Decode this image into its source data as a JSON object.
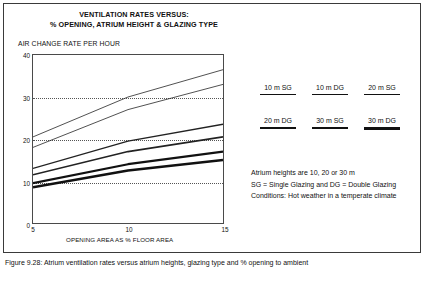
{
  "figure": {
    "title_line1": "VENTILATION RATES VERSUS:",
    "title_line2": "% OPENING, ATRIUM HEIGHT & GLAZING TYPE",
    "y_axis_title": "AIR CHANGE RATE PER HOUR",
    "x_axis_title": "OPENING AREA AS % FLOOR AREA",
    "caption": "Figure 9.28: Atrium ventilation rates versus atrium heights, glazing type and % opening to ambient"
  },
  "notes": {
    "line1": "Atrium heights are 10, 20 or 30 m",
    "line2": "SG = Single Glazing and DG = Double Glazing",
    "line3": "Conditions: Hot weather in a temperate climate"
  },
  "chart_data": {
    "type": "line",
    "title": "VENTILATION RATES VERSUS: % OPENING, ATRIUM HEIGHT & GLAZING TYPE",
    "xlabel": "OPENING AREA AS % FLOOR AREA",
    "ylabel": "AIR CHANGE RATE PER HOUR",
    "xlim": [
      5,
      15
    ],
    "ylim": [
      0,
      40
    ],
    "xticks": [
      5,
      10,
      15
    ],
    "yticks": [
      0,
      10,
      20,
      30,
      40
    ],
    "grid": "horizontal-dotted",
    "legend_position": "right",
    "x": [
      5,
      10,
      15
    ],
    "series": [
      {
        "name": "10 m SG",
        "values": [
          20.5,
          30.0,
          36.5
        ],
        "width": 0.8,
        "color": "#222222"
      },
      {
        "name": "10 m DG",
        "values": [
          18.0,
          27.0,
          33.0
        ],
        "width": 0.8,
        "color": "#222222"
      },
      {
        "name": "20 m SG",
        "values": [
          13.0,
          19.5,
          23.5
        ],
        "width": 1.4,
        "color": "#222222"
      },
      {
        "name": "20 m DG",
        "values": [
          11.5,
          17.0,
          20.5
        ],
        "width": 1.6,
        "color": "#222222"
      },
      {
        "name": "30 m SG",
        "values": [
          9.5,
          14.0,
          17.0
        ],
        "width": 2.2,
        "color": "#111111"
      },
      {
        "name": "30 m DG",
        "values": [
          8.5,
          12.5,
          15.0
        ],
        "width": 2.6,
        "color": "#111111"
      }
    ]
  },
  "legend": {
    "rows": [
      [
        {
          "label": "10 m SG",
          "width": 0.8
        },
        {
          "label": "10 m DG",
          "width": 1.2
        },
        {
          "label": "20 m SG",
          "width": 1.8
        }
      ],
      [
        {
          "label": "20 m DG",
          "width": 2.2
        },
        {
          "label": "30 m SG",
          "width": 2.8
        },
        {
          "label": "30 m DG",
          "width": 3.4
        }
      ]
    ]
  }
}
